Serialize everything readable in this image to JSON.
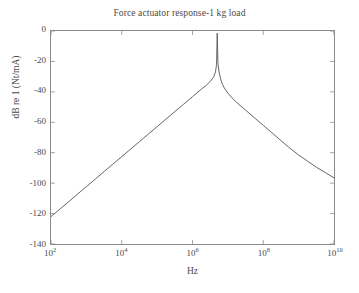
{
  "figure": {
    "width": 359,
    "height": 293,
    "background_color": "#ffffff",
    "axis_color": "#8a8a8a",
    "text_color": "#4a4a4a",
    "line_color": "#555555"
  },
  "chart_data": {
    "type": "line",
    "title": "Force actuator response-1 kg load",
    "xlabel": "Hz",
    "ylabel": "dB re 1 (Nt/mA)",
    "xscale": "log",
    "yscale": "linear",
    "xlim": [
      100,
      10000000000
    ],
    "ylim": [
      -140,
      0
    ],
    "grid": false,
    "legend": null,
    "xtick_labels": [
      "10²",
      "10⁴",
      "10⁶",
      "10⁸",
      "10¹⁰"
    ],
    "xtick_bases": [
      "10",
      "10",
      "10",
      "10",
      "10"
    ],
    "xtick_exponents": [
      "2",
      "4",
      "6",
      "8",
      "10"
    ],
    "xtick_values": [
      100,
      10000,
      1000000,
      100000000,
      10000000000
    ],
    "ytick_labels": [
      "0",
      "-20",
      "-40",
      "-60",
      "-80",
      "-100",
      "-120",
      "-140"
    ],
    "ytick_values": [
      0,
      -20,
      -40,
      -60,
      -80,
      -100,
      -120,
      -140
    ],
    "resonance_frequency_hz": 5000000,
    "peak_value_db": -1.5,
    "series": [
      {
        "name": "Force actuator response",
        "x": [
          100,
          178,
          316,
          562,
          1000,
          1778,
          3162,
          5623,
          10000,
          17783,
          31623,
          56234,
          100000,
          177828,
          316228,
          562341,
          1000000,
          1778279,
          2511886,
          3162278,
          3981072,
          4466836,
          4786301,
          5000000,
          5248075,
          5623413,
          6309573,
          7079458,
          7943282,
          10000000,
          12589254,
          17782794,
          31622777,
          56234133,
          100000000,
          177827941,
          316227766,
          562341325,
          1000000000,
          1778279410,
          3162277660,
          5623413252,
          10000000000
        ],
        "y": [
          -122.0,
          -117.1,
          -112.2,
          -107.2,
          -102.3,
          -97.4,
          -92.4,
          -87.5,
          -82.6,
          -77.6,
          -72.7,
          -67.8,
          -62.9,
          -57.9,
          -53.0,
          -48.1,
          -43.2,
          -38.2,
          -35.5,
          -33.2,
          -30.2,
          -26.8,
          -22.0,
          -1.5,
          -21.5,
          -27.0,
          -32.0,
          -35.2,
          -37.5,
          -40.8,
          -43.5,
          -47.0,
          -52.0,
          -57.0,
          -62.0,
          -67.0,
          -72.0,
          -77.0,
          -81.5,
          -85.5,
          -89.5,
          -93.0,
          -96.5
        ]
      }
    ],
    "annotations": [],
    "notes": {
      "low_frequency_slope_db_per_decade": 40,
      "high_frequency_slope_db_per_decade": -20
    }
  }
}
